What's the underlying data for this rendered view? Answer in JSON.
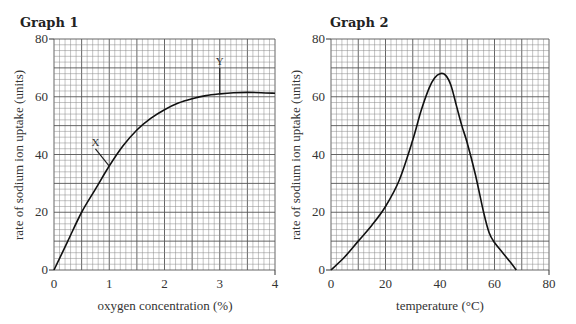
{
  "chart_data": [
    {
      "type": "line",
      "title": "Graph 1",
      "xlabel": "oxygen concentration (%)",
      "ylabel": "rate of sodium ion uptake (units)",
      "xlim": [
        0,
        4
      ],
      "ylim": [
        0,
        80
      ],
      "xticks": [
        0,
        1,
        2,
        3,
        4
      ],
      "yticks": [
        0,
        20,
        40,
        60,
        80
      ],
      "grid": true,
      "x": [
        0,
        0.25,
        0.5,
        0.75,
        1.0,
        1.25,
        1.5,
        1.75,
        2.0,
        2.25,
        2.5,
        2.75,
        3.0,
        3.25,
        3.5,
        3.75,
        4.0
      ],
      "y": [
        0,
        10,
        20,
        28,
        36,
        43,
        48.5,
        52.5,
        55.5,
        57.8,
        59.3,
        60.4,
        61,
        61.4,
        61.5,
        61.4,
        61.2
      ],
      "annotations": [
        {
          "label": "X",
          "at_x": 1.0,
          "at_y": 36,
          "text_x": 0.75,
          "text_y": 43
        },
        {
          "label": "Y",
          "at_x": 3.0,
          "at_y": 61,
          "text_x": 3.0,
          "text_y": 71
        }
      ]
    },
    {
      "type": "line",
      "title": "Graph 2",
      "xlabel": "temperature (°C)",
      "ylabel": "rate of sodium ion uptake (units)",
      "xlim": [
        0,
        80
      ],
      "ylim": [
        0,
        80
      ],
      "xticks": [
        0,
        20,
        40,
        60,
        80
      ],
      "yticks": [
        0,
        20,
        40,
        60,
        80
      ],
      "grid": true,
      "x": [
        0,
        5,
        10,
        15,
        20,
        25,
        30,
        33,
        36,
        38,
        40,
        42,
        44,
        46,
        48,
        50,
        53,
        56,
        58,
        60,
        63,
        66,
        68
      ],
      "y": [
        0,
        4.5,
        10,
        15.5,
        22,
        31,
        45,
        55,
        63,
        66.5,
        68,
        67.5,
        64,
        57,
        50,
        44,
        33,
        20,
        13,
        9.5,
        6,
        2.5,
        0
      ],
      "annotations": []
    }
  ],
  "graph1": {
    "title": "Graph 1",
    "xlabel": "oxygen concentration (%)",
    "ylabel": "rate of sodium ion uptake (units)",
    "marker_x": "X",
    "marker_y": "Y"
  },
  "graph2": {
    "title": "Graph 2",
    "xlabel": "temperature (°C)",
    "ylabel": "rate of sodium ion uptake (units)"
  }
}
